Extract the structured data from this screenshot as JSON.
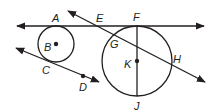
{
  "diagram": {
    "type": "geometry-circles",
    "colors": {
      "ink": "#231f20",
      "background": "#ffffff"
    },
    "circles": [
      {
        "name": "B",
        "label": "B",
        "cx": 56,
        "cy": 44,
        "r": 18
      },
      {
        "name": "K",
        "label": "K",
        "cx": 137,
        "cy": 61,
        "r": 35
      }
    ],
    "lines": [
      {
        "name": "line-AF",
        "points": [
          "A",
          "E",
          "F"
        ],
        "description": "common tangent line through A and F"
      },
      {
        "name": "line-CD",
        "points": [
          "C",
          "D"
        ],
        "description": "tangent to circle B at C"
      },
      {
        "name": "line-EH",
        "points": [
          "E",
          "G",
          "H"
        ],
        "description": "secant through E, G, H"
      }
    ],
    "segments": [
      {
        "name": "diameter-FJ",
        "points": [
          "F",
          "K",
          "J"
        ]
      }
    ],
    "labels": {
      "A": "A",
      "B": "B",
      "C": "C",
      "D": "D",
      "E": "E",
      "F": "F",
      "G": "G",
      "H": "H",
      "J": "J",
      "K": "K"
    }
  }
}
